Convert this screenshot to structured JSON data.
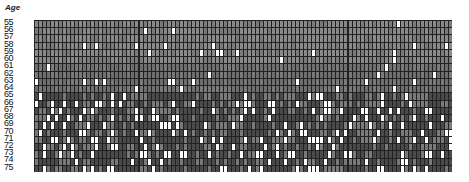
{
  "chart_data": {
    "type": "heatmap",
    "title": "Age",
    "ylabel": "Age",
    "rows": [
      "55",
      "56",
      "57",
      "58",
      "59",
      "60",
      "61",
      "62",
      "63",
      "64",
      "65",
      "66",
      "67",
      "68",
      "69",
      "70",
      "71",
      "72",
      "73",
      "74",
      "75"
    ],
    "n_columns": 104,
    "colors": {
      "early": "#8a8a8a",
      "mid": "#6e6e6e",
      "late": "#4a4a4a",
      "highlight": "#ffffff",
      "border": "#222222"
    },
    "note": "Cells are grey; white cells become more frequent at older ages (66-75)."
  }
}
